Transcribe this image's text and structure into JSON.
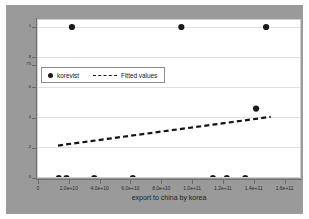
{
  "chart_data": {
    "type": "scatter",
    "title": "",
    "xlabel": "export to china by korea",
    "ylabel": "",
    "xlim": [
      0,
      170000000000
    ],
    "ylim": [
      0,
      1
    ],
    "grid": true,
    "legend_position": "inside-upper-left",
    "x_ticks": [
      {
        "value": 0,
        "label": "0"
      },
      {
        "value": 20000000000,
        "label": "2.0e+10"
      },
      {
        "value": 40000000000,
        "label": "4.0e+10"
      },
      {
        "value": 60000000000,
        "label": "6.0e+10"
      },
      {
        "value": 80000000000,
        "label": "8.0e+10"
      },
      {
        "value": 100000000000,
        "label": "1.0e+11"
      },
      {
        "value": 120000000000,
        "label": "1.2e+11"
      },
      {
        "value": 140000000000,
        "label": "1.4e+11"
      },
      {
        "value": 160000000000,
        "label": "1.6e+11"
      }
    ],
    "y_ticks": [
      {
        "value": 1.0,
        "label": "1"
      },
      {
        "value": 0.8,
        "label": ".8"
      },
      {
        "value": 0.75,
        "label": ".75"
      },
      {
        "value": 0.6,
        "label": ".6"
      },
      {
        "value": 0.4,
        "label": ".4"
      },
      {
        "value": 0.2,
        "label": ".2"
      },
      {
        "value": 0.0,
        "label": "0"
      }
    ],
    "series": [
      {
        "name": "korevist",
        "type": "scatter",
        "marker": "filled-circle",
        "color": "#1a1a1a",
        "points": [
          {
            "x": 13500000000,
            "y": 0.0
          },
          {
            "x": 18500000000,
            "y": 0.0
          },
          {
            "x": 22000000000,
            "y": 1.0
          },
          {
            "x": 36500000000,
            "y": 0.0
          },
          {
            "x": 61500000000,
            "y": 0.0
          },
          {
            "x": 93000000000,
            "y": 1.0
          },
          {
            "x": 113500000000,
            "y": 0.0
          },
          {
            "x": 122500000000,
            "y": 0.0
          },
          {
            "x": 134500000000,
            "y": 0.0
          },
          {
            "x": 141500000000,
            "y": 0.46
          },
          {
            "x": 148000000000,
            "y": 1.0
          }
        ]
      },
      {
        "name": "Fitted values",
        "type": "line",
        "style": "dashed",
        "color": "#141414",
        "points": [
          {
            "x": 13000000000,
            "y": 0.215
          },
          {
            "x": 151000000000,
            "y": 0.405
          }
        ]
      }
    ]
  },
  "legend": {
    "entries": [
      {
        "label": "korevist",
        "marker": "filled-circle"
      },
      {
        "label": "Fitted values",
        "marker": "dashed-line"
      }
    ]
  },
  "axis_titles": {
    "x": "export to china by korea"
  },
  "colors": {
    "graph_region": "#9a9a9a",
    "plot_region": "#ffffff",
    "marker": "#1a1a1a",
    "fit_line": "#141414",
    "gridline": "#e0e0e0",
    "axis": "#707070"
  }
}
